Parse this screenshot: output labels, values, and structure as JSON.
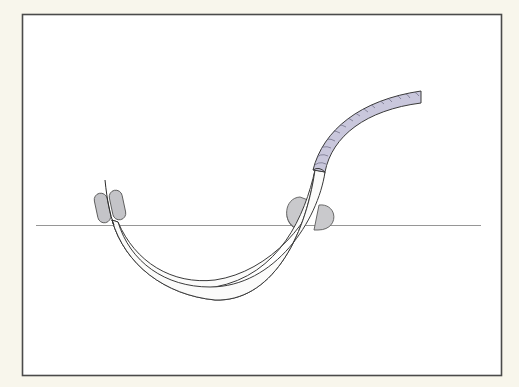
{
  "diagram": {
    "description": "Medical illustration: curved catheter/tube passing through a surface (skin line) with a braided section and retention pads",
    "colors": {
      "background": "#f8f6ec",
      "frame_fill": "#ffffff",
      "frame_stroke": "#4a4a4a",
      "surface_line": "#8a8a8a",
      "tube_fill": "#fbfbfa",
      "tube_stroke": "#3a3a3a",
      "braid_fill": "#c9c7dc",
      "braid_pattern": "#6a6880",
      "pad_fill": "#c4c4c8",
      "pad_stroke": "#5a5a5a"
    },
    "elements": {
      "frame": "frame",
      "surface_line": "surface-line",
      "tube": "curved-tube",
      "braided_section": "braided-tube-section",
      "guide_wire": "guide-wire",
      "left_pads": "left-retention-pads",
      "right_cuffs": "right-cuff-blobs"
    }
  }
}
